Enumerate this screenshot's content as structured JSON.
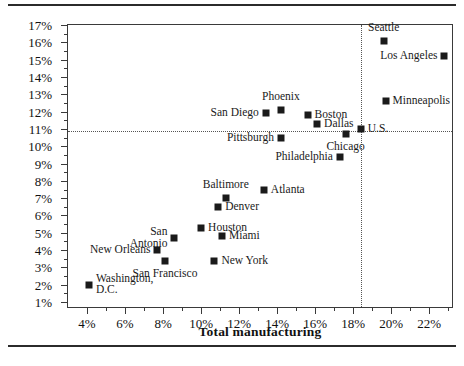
{
  "chart_data": {
    "type": "scatter",
    "title": "",
    "xlabel": "Total manufacturing",
    "ylabel": "Manufacturing — durables",
    "xlim": [
      3.0,
      23.3
    ],
    "ylim": [
      0.6,
      17.0
    ],
    "xticks": [
      "4%",
      "6%",
      "8%",
      "10%",
      "12%",
      "14%",
      "16%",
      "18%",
      "20%",
      "22%"
    ],
    "xtick_values": [
      4,
      6,
      8,
      10,
      12,
      14,
      16,
      18,
      20,
      22
    ],
    "xminor_values": [
      5,
      7,
      9,
      11,
      13,
      15,
      17,
      19,
      21,
      23
    ],
    "yticks": [
      "1%",
      "2%",
      "3%",
      "4%",
      "5%",
      "6%",
      "7%",
      "8%",
      "9%",
      "10%",
      "11%",
      "12%",
      "13%",
      "14%",
      "15%",
      "16%",
      "17%"
    ],
    "ytick_values": [
      1,
      2,
      3,
      4,
      5,
      6,
      7,
      8,
      9,
      10,
      11,
      12,
      13,
      14,
      15,
      16,
      17
    ],
    "grid": false,
    "legend": "none",
    "reference_lines": {
      "horizontal_label": "U.S. durables share",
      "horizontal_value": 10.9,
      "vertical_label": "U.S. total manufacturing",
      "vertical_value": 18.4,
      "style": "dotted"
    },
    "marker": {
      "shape": "square",
      "color": "#1a1a1a",
      "size_px": 7
    },
    "points": [
      {
        "name": "Seattle",
        "x": 19.6,
        "y": 16.1,
        "label": "Seattle",
        "label_pos": "above"
      },
      {
        "name": "Los Angeles",
        "x": 22.8,
        "y": 15.2,
        "label": "Los Angeles",
        "label_pos": "left"
      },
      {
        "name": "Minneapolis",
        "x": 19.7,
        "y": 12.6,
        "label": "Minneapolis",
        "label_pos": "right"
      },
      {
        "name": "Phoenix",
        "x": 14.2,
        "y": 12.1,
        "label": "Phoenix",
        "label_pos": "above"
      },
      {
        "name": "San Diego",
        "x": 13.4,
        "y": 11.9,
        "label": "San Diego",
        "label_pos": "left"
      },
      {
        "name": "Boston",
        "x": 15.6,
        "y": 11.8,
        "label": "Boston",
        "label_pos": "right"
      },
      {
        "name": "Dallas",
        "x": 16.1,
        "y": 11.3,
        "label": "Dallas",
        "label_pos": "right"
      },
      {
        "name": "U.S.",
        "x": 18.4,
        "y": 11.0,
        "label": "U.S.",
        "label_pos": "right"
      },
      {
        "name": "Chicago",
        "x": 17.6,
        "y": 10.7,
        "label": "Chicago",
        "label_pos": "below"
      },
      {
        "name": "Pittsburgh",
        "x": 14.2,
        "y": 10.5,
        "label": "Pittsburgh",
        "label_pos": "left"
      },
      {
        "name": "Philadelphia",
        "x": 17.3,
        "y": 9.4,
        "label": "Philadelphia",
        "label_pos": "left"
      },
      {
        "name": "Atlanta",
        "x": 13.3,
        "y": 7.5,
        "label": "Atlanta",
        "label_pos": "right"
      },
      {
        "name": "Baltimore",
        "x": 11.3,
        "y": 7.0,
        "label": "Baltimore",
        "label_pos": "above"
      },
      {
        "name": "Denver",
        "x": 10.9,
        "y": 6.5,
        "label": "Denver",
        "label_pos": "right"
      },
      {
        "name": "Houston",
        "x": 10.0,
        "y": 5.3,
        "label": "Houston",
        "label_pos": "right"
      },
      {
        "name": "Miami",
        "x": 11.1,
        "y": 4.8,
        "label": "Miami",
        "label_pos": "right"
      },
      {
        "name": "San Antonio",
        "x": 8.6,
        "y": 4.7,
        "label": "San\nAntonio",
        "label_pos": "left"
      },
      {
        "name": "San Francisco",
        "x": 8.1,
        "y": 3.4,
        "label": "San Francisco",
        "label_pos": "below"
      },
      {
        "name": "New York",
        "x": 10.7,
        "y": 3.4,
        "label": "New York",
        "label_pos": "right"
      },
      {
        "name": "New Orleans",
        "x": 7.7,
        "y": 4.0,
        "label": "New Orleans",
        "label_pos": "left"
      },
      {
        "name": "Washington, D.C.",
        "x": 4.1,
        "y": 2.0,
        "label": "Washington,\nD.C.",
        "label_pos": "right"
      }
    ]
  }
}
